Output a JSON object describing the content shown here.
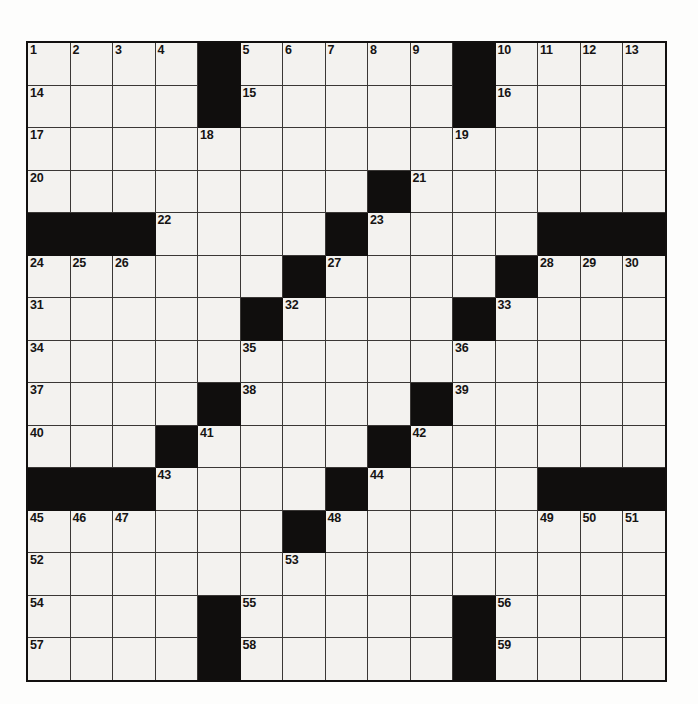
{
  "puzzle": {
    "title": "Crossword Puzzle Grid",
    "rows": 15,
    "cols": 15,
    "colors": {
      "block": "#100e0d",
      "cell": "#f3f2ef",
      "grid_line": "#3a3735",
      "number": "#161413",
      "page": "#fdfdfc"
    },
    "caption": "",
    "grid": [
      [
        {
          "num": "1",
          "block": false
        },
        {
          "num": "2",
          "block": false
        },
        {
          "num": "3",
          "block": false
        },
        {
          "num": "4",
          "block": false
        },
        {
          "num": "",
          "block": true
        },
        {
          "num": "5",
          "block": false
        },
        {
          "num": "6",
          "block": false
        },
        {
          "num": "7",
          "block": false
        },
        {
          "num": "8",
          "block": false
        },
        {
          "num": "9",
          "block": false
        },
        {
          "num": "",
          "block": true
        },
        {
          "num": "10",
          "block": false
        },
        {
          "num": "11",
          "block": false
        },
        {
          "num": "12",
          "block": false
        },
        {
          "num": "13",
          "block": false
        }
      ],
      [
        {
          "num": "14",
          "block": false
        },
        {
          "num": "",
          "block": false
        },
        {
          "num": "",
          "block": false
        },
        {
          "num": "",
          "block": false
        },
        {
          "num": "",
          "block": true
        },
        {
          "num": "15",
          "block": false
        },
        {
          "num": "",
          "block": false
        },
        {
          "num": "",
          "block": false
        },
        {
          "num": "",
          "block": false
        },
        {
          "num": "",
          "block": false
        },
        {
          "num": "",
          "block": true
        },
        {
          "num": "16",
          "block": false
        },
        {
          "num": "",
          "block": false
        },
        {
          "num": "",
          "block": false
        },
        {
          "num": "",
          "block": false
        }
      ],
      [
        {
          "num": "17",
          "block": false
        },
        {
          "num": "",
          "block": false
        },
        {
          "num": "",
          "block": false
        },
        {
          "num": "",
          "block": false
        },
        {
          "num": "18",
          "block": false
        },
        {
          "num": "",
          "block": false
        },
        {
          "num": "",
          "block": false
        },
        {
          "num": "",
          "block": false
        },
        {
          "num": "",
          "block": false
        },
        {
          "num": "",
          "block": false
        },
        {
          "num": "19",
          "block": false
        },
        {
          "num": "",
          "block": false
        },
        {
          "num": "",
          "block": false
        },
        {
          "num": "",
          "block": false
        },
        {
          "num": "",
          "block": false
        }
      ],
      [
        {
          "num": "20",
          "block": false
        },
        {
          "num": "",
          "block": false
        },
        {
          "num": "",
          "block": false
        },
        {
          "num": "",
          "block": false
        },
        {
          "num": "",
          "block": false
        },
        {
          "num": "",
          "block": false
        },
        {
          "num": "",
          "block": false
        },
        {
          "num": "",
          "block": false
        },
        {
          "num": "",
          "block": true
        },
        {
          "num": "21",
          "block": false
        },
        {
          "num": "",
          "block": false
        },
        {
          "num": "",
          "block": false
        },
        {
          "num": "",
          "block": false
        },
        {
          "num": "",
          "block": false
        },
        {
          "num": "",
          "block": false
        }
      ],
      [
        {
          "num": "",
          "block": true
        },
        {
          "num": "",
          "block": true
        },
        {
          "num": "",
          "block": true
        },
        {
          "num": "22",
          "block": false
        },
        {
          "num": "",
          "block": false
        },
        {
          "num": "",
          "block": false
        },
        {
          "num": "",
          "block": false
        },
        {
          "num": "",
          "block": true
        },
        {
          "num": "23",
          "block": false
        },
        {
          "num": "",
          "block": false
        },
        {
          "num": "",
          "block": false
        },
        {
          "num": "",
          "block": false
        },
        {
          "num": "",
          "block": true
        },
        {
          "num": "",
          "block": true
        },
        {
          "num": "",
          "block": true
        }
      ],
      [
        {
          "num": "24",
          "block": false
        },
        {
          "num": "25",
          "block": false
        },
        {
          "num": "26",
          "block": false
        },
        {
          "num": "",
          "block": false
        },
        {
          "num": "",
          "block": false
        },
        {
          "num": "",
          "block": false
        },
        {
          "num": "",
          "block": true
        },
        {
          "num": "27",
          "block": false
        },
        {
          "num": "",
          "block": false
        },
        {
          "num": "",
          "block": false
        },
        {
          "num": "",
          "block": false
        },
        {
          "num": "",
          "block": true
        },
        {
          "num": "28",
          "block": false
        },
        {
          "num": "29",
          "block": false
        },
        {
          "num": "30",
          "block": false
        }
      ],
      [
        {
          "num": "31",
          "block": false
        },
        {
          "num": "",
          "block": false
        },
        {
          "num": "",
          "block": false
        },
        {
          "num": "",
          "block": false
        },
        {
          "num": "",
          "block": false
        },
        {
          "num": "",
          "block": true
        },
        {
          "num": "32",
          "block": false
        },
        {
          "num": "",
          "block": false
        },
        {
          "num": "",
          "block": false
        },
        {
          "num": "",
          "block": false
        },
        {
          "num": "",
          "block": true
        },
        {
          "num": "33",
          "block": false
        },
        {
          "num": "",
          "block": false
        },
        {
          "num": "",
          "block": false
        },
        {
          "num": "",
          "block": false
        }
      ],
      [
        {
          "num": "34",
          "block": false
        },
        {
          "num": "",
          "block": false
        },
        {
          "num": "",
          "block": false
        },
        {
          "num": "",
          "block": false
        },
        {
          "num": "",
          "block": false
        },
        {
          "num": "35",
          "block": false
        },
        {
          "num": "",
          "block": false
        },
        {
          "num": "",
          "block": false
        },
        {
          "num": "",
          "block": false
        },
        {
          "num": "",
          "block": false
        },
        {
          "num": "36",
          "block": false
        },
        {
          "num": "",
          "block": false
        },
        {
          "num": "",
          "block": false
        },
        {
          "num": "",
          "block": false
        },
        {
          "num": "",
          "block": false
        }
      ],
      [
        {
          "num": "37",
          "block": false
        },
        {
          "num": "",
          "block": false
        },
        {
          "num": "",
          "block": false
        },
        {
          "num": "",
          "block": false
        },
        {
          "num": "",
          "block": true
        },
        {
          "num": "38",
          "block": false
        },
        {
          "num": "",
          "block": false
        },
        {
          "num": "",
          "block": false
        },
        {
          "num": "",
          "block": false
        },
        {
          "num": "",
          "block": true
        },
        {
          "num": "39",
          "block": false
        },
        {
          "num": "",
          "block": false
        },
        {
          "num": "",
          "block": false
        },
        {
          "num": "",
          "block": false
        },
        {
          "num": "",
          "block": false
        }
      ],
      [
        {
          "num": "40",
          "block": false
        },
        {
          "num": "",
          "block": false
        },
        {
          "num": "",
          "block": false
        },
        {
          "num": "",
          "block": true
        },
        {
          "num": "41",
          "block": false
        },
        {
          "num": "",
          "block": false
        },
        {
          "num": "",
          "block": false
        },
        {
          "num": "",
          "block": false
        },
        {
          "num": "",
          "block": true
        },
        {
          "num": "42",
          "block": false
        },
        {
          "num": "",
          "block": false
        },
        {
          "num": "",
          "block": false
        },
        {
          "num": "",
          "block": false
        },
        {
          "num": "",
          "block": false
        },
        {
          "num": "",
          "block": false
        }
      ],
      [
        {
          "num": "",
          "block": true
        },
        {
          "num": "",
          "block": true
        },
        {
          "num": "",
          "block": true
        },
        {
          "num": "43",
          "block": false
        },
        {
          "num": "",
          "block": false
        },
        {
          "num": "",
          "block": false
        },
        {
          "num": "",
          "block": false
        },
        {
          "num": "",
          "block": true
        },
        {
          "num": "44",
          "block": false
        },
        {
          "num": "",
          "block": false
        },
        {
          "num": "",
          "block": false
        },
        {
          "num": "",
          "block": false
        },
        {
          "num": "",
          "block": true
        },
        {
          "num": "",
          "block": true
        },
        {
          "num": "",
          "block": true
        }
      ],
      [
        {
          "num": "45",
          "block": false
        },
        {
          "num": "46",
          "block": false
        },
        {
          "num": "47",
          "block": false
        },
        {
          "num": "",
          "block": false
        },
        {
          "num": "",
          "block": false
        },
        {
          "num": "",
          "block": false
        },
        {
          "num": "",
          "block": true
        },
        {
          "num": "48",
          "block": false
        },
        {
          "num": "",
          "block": false
        },
        {
          "num": "",
          "block": false
        },
        {
          "num": "",
          "block": false
        },
        {
          "num": "",
          "block": false
        },
        {
          "num": "49",
          "block": false
        },
        {
          "num": "50",
          "block": false
        },
        {
          "num": "51",
          "block": false
        }
      ],
      [
        {
          "num": "52",
          "block": false
        },
        {
          "num": "",
          "block": false
        },
        {
          "num": "",
          "block": false
        },
        {
          "num": "",
          "block": false
        },
        {
          "num": "",
          "block": false
        },
        {
          "num": "",
          "block": false
        },
        {
          "num": "53",
          "block": false
        },
        {
          "num": "",
          "block": false
        },
        {
          "num": "",
          "block": false
        },
        {
          "num": "",
          "block": false
        },
        {
          "num": "",
          "block": false
        },
        {
          "num": "",
          "block": false
        },
        {
          "num": "",
          "block": false
        },
        {
          "num": "",
          "block": false
        },
        {
          "num": "",
          "block": false
        }
      ],
      [
        {
          "num": "54",
          "block": false
        },
        {
          "num": "",
          "block": false
        },
        {
          "num": "",
          "block": false
        },
        {
          "num": "",
          "block": false
        },
        {
          "num": "",
          "block": true
        },
        {
          "num": "55",
          "block": false
        },
        {
          "num": "",
          "block": false
        },
        {
          "num": "",
          "block": false
        },
        {
          "num": "",
          "block": false
        },
        {
          "num": "",
          "block": false
        },
        {
          "num": "",
          "block": true
        },
        {
          "num": "56",
          "block": false
        },
        {
          "num": "",
          "block": false
        },
        {
          "num": "",
          "block": false
        },
        {
          "num": "",
          "block": false
        }
      ],
      [
        {
          "num": "57",
          "block": false
        },
        {
          "num": "",
          "block": false
        },
        {
          "num": "",
          "block": false
        },
        {
          "num": "",
          "block": false
        },
        {
          "num": "",
          "block": true
        },
        {
          "num": "58",
          "block": false
        },
        {
          "num": "",
          "block": false
        },
        {
          "num": "",
          "block": false
        },
        {
          "num": "",
          "block": false
        },
        {
          "num": "",
          "block": false
        },
        {
          "num": "",
          "block": true
        },
        {
          "num": "59",
          "block": false
        },
        {
          "num": "",
          "block": false
        },
        {
          "num": "",
          "block": false
        },
        {
          "num": "",
          "block": false
        }
      ]
    ]
  }
}
